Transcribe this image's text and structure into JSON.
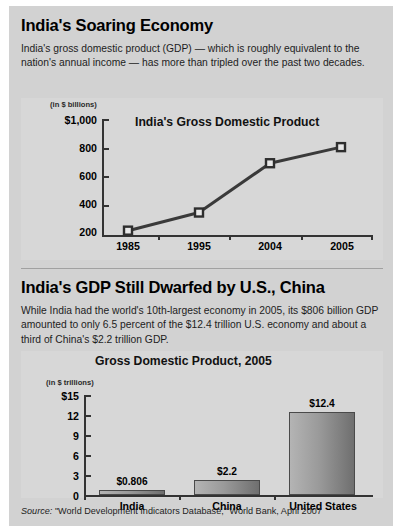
{
  "sections": [
    {
      "title": "India's Soaring Economy",
      "body": "India's gross domestic product (GDP) — which is roughly equivalent to the nation's annual income — has more than tripled over the past two decades."
    },
    {
      "title": "India's GDP Still Dwarfed by U.S., China",
      "body": "While India had the world's 10th-largest economy in 2005, its $806 billion GDP amounted to only 6.5 percent of the $12.4 trillion U.S. economy and about a third of China's $2.2 trillion GDP."
    }
  ],
  "source": {
    "label": "Source:",
    "text": "\"World Development Indicators Database,\" World Bank, April 2007"
  },
  "chart_data": [
    {
      "type": "line",
      "title": "India's Gross Domestic Product",
      "unit_label": "(in $ billions)",
      "xlabel": "",
      "ylabel": "",
      "categories": [
        "1985",
        "1995",
        "2004",
        "2005"
      ],
      "values": [
        230,
        355,
        695,
        806
      ],
      "ylim": [
        200,
        1000
      ],
      "yticks": [
        200,
        400,
        600,
        800,
        1000
      ],
      "ytick_labels": [
        "200",
        "400",
        "600",
        "800",
        "$1,000"
      ],
      "grid": false,
      "legend": "none",
      "marker": "square"
    },
    {
      "type": "bar",
      "title": "Gross Domestic Product, 2005",
      "unit_label": "(in $ trillions)",
      "xlabel": "",
      "ylabel": "",
      "categories": [
        "India",
        "China",
        "United States"
      ],
      "values": [
        0.806,
        2.2,
        12.4
      ],
      "value_labels": [
        "$0.806",
        "$2.2",
        "$12.4"
      ],
      "ylim": [
        0,
        15
      ],
      "yticks": [
        0,
        3,
        6,
        9,
        12,
        15
      ],
      "ytick_labels": [
        "0",
        "3",
        "6",
        "9",
        "12",
        "$15"
      ],
      "grid": false,
      "legend": "none"
    }
  ],
  "colors": {
    "page_background": "#ffffff",
    "panel_background": "#d2d2d2",
    "chart_background": "#d7d7d7",
    "axis": "#333333",
    "line_series": "#3a3a3a",
    "bar_light": "#b4b4b4",
    "bar_dark": "#6f6f6f",
    "text": "#000000"
  }
}
